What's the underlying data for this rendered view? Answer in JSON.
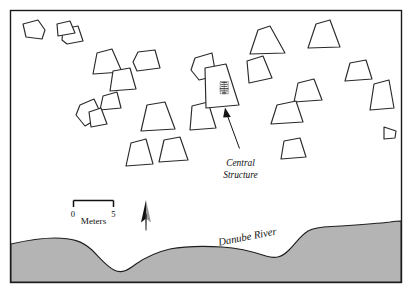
{
  "figure": {
    "type": "archaeological-site-plan",
    "background_color": "#ffffff",
    "frame_color": "#1a1a1a"
  },
  "annotations": {
    "central_structure": {
      "line1": "Central",
      "line2": "Structure"
    },
    "river": {
      "label": "Danube River",
      "fill_color": "#b4b4b4",
      "rotation_degrees": -11
    }
  },
  "scale_bar": {
    "min_label": "0",
    "max_label": "5",
    "unit_label": "Meters",
    "length_px": 52
  },
  "north_arrow": {
    "name": "north-arrow",
    "dark_color": "#111111",
    "light_color": "#9a9a9a"
  },
  "structures": {
    "count": 24,
    "stroke_color": "#2a2a2a",
    "fill_color": "#ffffff",
    "items": [
      {
        "id": "hut-01",
        "points": "23,24 38,20 45,30 42,39 26,37"
      },
      {
        "id": "hut-02",
        "points": "63,29 78,26 83,41 67,44 62,40"
      },
      {
        "id": "hut-03",
        "points": "97,53 112,49 122,72 93,74"
      },
      {
        "id": "hut-04",
        "points": "138,52 155,50 160,68 137,71 133,62"
      },
      {
        "id": "hut-05",
        "points": "113,71 130,68 136,89 110,91"
      },
      {
        "id": "hut-06",
        "points": "103,96 117,92 121,108 100,110"
      },
      {
        "id": "hut-07",
        "points": "80,105 94,99 102,116 85,126 76,115"
      },
      {
        "id": "hut-08",
        "points": "147,105 165,102 175,129 141,131"
      },
      {
        "id": "hut-09",
        "points": "192,106 208,102 216,128 190,130"
      },
      {
        "id": "hut-10",
        "points": "131,143 146,139 153,164 126,166"
      },
      {
        "id": "hut-11",
        "points": "164,140 180,137 188,160 159,162"
      },
      {
        "id": "hut-12",
        "points": "195,58 212,53 216,76 199,80 191,70"
      },
      {
        "id": "hut-13",
        "points": "258,30 270,26 285,53 250,54"
      },
      {
        "id": "hut-14",
        "points": "247,61 263,56 272,78 249,83"
      },
      {
        "id": "hut-15",
        "points": "316,24 330,20 340,47 308,48"
      },
      {
        "id": "hut-16",
        "points": "350,63 366,60 372,79 345,81"
      },
      {
        "id": "hut-17",
        "points": "298,83 314,79 322,100 294,102"
      },
      {
        "id": "hut-18",
        "points": "277,105 296,101 303,122 271,124"
      },
      {
        "id": "hut-19",
        "points": "284,141 300,138 306,157 281,159"
      },
      {
        "id": "hut-20",
        "points": "374,84 389,80 394,108 370,110"
      },
      {
        "id": "hut-21",
        "points": "384,127 396,131 395,138 384,139"
      },
      {
        "id": "hut-22",
        "points": "57,24 70,21 75,33 58,36"
      },
      {
        "id": "hut-23",
        "points": "205,68 226,64 239,105 206,108"
      },
      {
        "id": "hut-24",
        "points": "89,112 101,108 107,124 91,127"
      }
    ],
    "central_structure_id": "hut-23"
  },
  "river_outline": {
    "path": "M 11,244 C 24,241 38,238 55,238 C 72,238 82,241 92,250 C 100,258 106,266 114,270 C 122,274 128,270 136,264 C 146,257 157,252 170,249 C 186,246 205,246 222,247 C 240,248 254,252 266,256 C 276,259 282,257 289,250 C 296,243 300,236 308,231 C 317,226 328,227 340,226 C 356,225 374,224 390,222 C 396,221 399,221 401,221 L 401,282 L 11,282 Z"
  }
}
